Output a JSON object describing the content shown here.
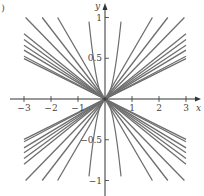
{
  "figure": {
    "corner_label": ")"
  },
  "chart_data": {
    "type": "line",
    "title": "",
    "xlabel": "x",
    "ylabel": "y",
    "xlim": [
      -3.3,
      3.5
    ],
    "ylim": [
      -1.15,
      1.15
    ],
    "x_ticks": [
      -3,
      -2,
      -1,
      1,
      2,
      3
    ],
    "x_tick_labels": [
      "−3",
      "−2",
      "−1",
      "1",
      "2",
      "3"
    ],
    "y_ticks": [
      1,
      0.5,
      -0.5,
      -1
    ],
    "y_tick_labels": [
      "1",
      "0.5",
      "−0.5",
      "−1"
    ],
    "grid": false,
    "legend": null,
    "line_color": "#6e6e6e",
    "axis_color": "#333333",
    "series": [
      {
        "name": "y=kx",
        "slopes": [
          0.165,
          0.175,
          0.2,
          0.22,
          0.243,
          0.267,
          0.34,
          0.43,
          0.57
        ]
      },
      {
        "name": "y=-kx",
        "slopes": [
          0.165,
          0.175,
          0.2,
          0.22,
          0.243,
          0.267,
          0.34,
          0.43,
          0.57
        ]
      },
      {
        "name": "steep curves",
        "form": "y = ±c·x^2",
        "c": [
          2.7
        ]
      }
    ]
  }
}
